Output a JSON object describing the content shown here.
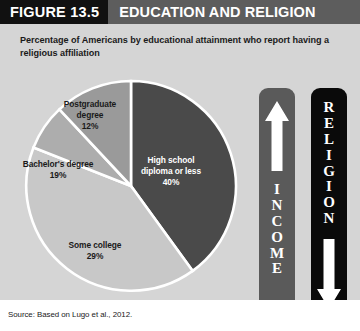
{
  "header": {
    "figure_number": "FIGURE 13.5",
    "title": "EDUCATION AND RELIGION",
    "number_block_color": "#111111",
    "bar_color": "#5d5d5d",
    "text_color": "#ffffff"
  },
  "subtitle": "Percentage of Americans by educational attainment who report having a religious affiliation",
  "labels": {
    "postgraduate": "Postgraduate\ndegree\n12%",
    "bachelors": "Bachelor's degree\n19%",
    "some_college": "Some college\n29%",
    "high_school": "High school\ndiploma or less\n40%"
  },
  "bars": {
    "income": {
      "word": "INCOME",
      "arrow": "up-arrow-icon",
      "background": "#5a5a5a",
      "foreground": "#ffffff"
    },
    "religion": {
      "word": "RELIGION",
      "arrow": "down-arrow-icon",
      "background": "#0a0a0a",
      "foreground": "#ffffff"
    }
  },
  "source": "Source: Based on Lugo et al., 2012.",
  "chart_data": {
    "type": "pie",
    "title": "Education and Religion",
    "subtitle": "Percentage of Americans by educational attainment who report having a religious affiliation",
    "categories": [
      "High school diploma or less",
      "Some college",
      "Bachelor's degree",
      "Postgraduate degree"
    ],
    "values": [
      40,
      29,
      19,
      12
    ],
    "value_labels": [
      "40%",
      "29%",
      "19%",
      "12%"
    ],
    "units": "percent",
    "colors": [
      "#4a4a4a",
      "#c8c8c8",
      "#adadad",
      "#9a9a9a"
    ],
    "start_angle_deg": 0,
    "direction": "clockwise",
    "legend": "none",
    "labels_inside": true,
    "separator_color": "#ffffff",
    "background": "#d5d5d5",
    "source": "Source: Based on Lugo et al., 2012.",
    "annotations": [
      {
        "text": "INCOME",
        "direction": "increasing",
        "arrow": "up"
      },
      {
        "text": "RELIGION",
        "direction": "decreasing",
        "arrow": "down"
      }
    ]
  }
}
